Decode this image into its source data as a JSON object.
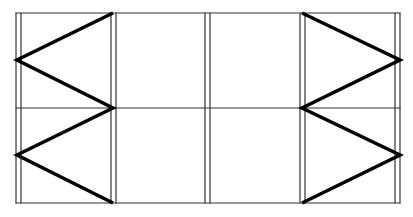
{
  "diagram": {
    "width": 413,
    "height": 217,
    "colors": {
      "background": "#ffffff",
      "thin_line": "#333333",
      "thick_line": "#000000"
    },
    "frame": {
      "top_y": 13,
      "mid_y": 108,
      "bottom_y": 203,
      "left_x": 16,
      "right_x": 400
    },
    "posts": [
      {
        "x1": 16,
        "x2": 21
      },
      {
        "x1": 111,
        "x2": 116
      },
      {
        "x1": 205,
        "x2": 210
      },
      {
        "x1": 300,
        "x2": 305
      },
      {
        "x1": 395,
        "x2": 400
      }
    ],
    "bracing": {
      "left": [
        [
          113,
          13
        ],
        [
          17,
          60
        ],
        [
          113,
          108
        ],
        [
          17,
          155
        ],
        [
          113,
          203
        ]
      ],
      "right": [
        [
          302,
          13
        ],
        [
          400,
          60
        ],
        [
          302,
          108
        ],
        [
          400,
          155
        ],
        [
          302,
          203
        ]
      ]
    }
  }
}
